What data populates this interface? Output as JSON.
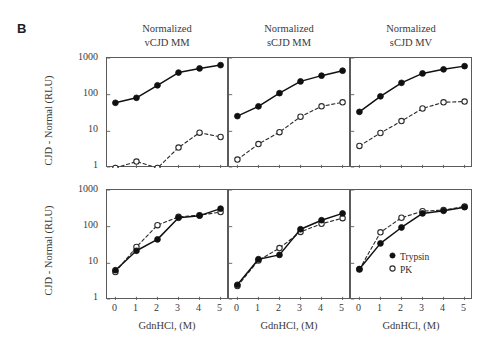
{
  "figure": {
    "panel_label": "B",
    "y_axis_label": "CJD - Normal (RLU)",
    "x_axis_label": "GdnHCl, (M)",
    "y_ticks": [
      "1000",
      "100",
      "10",
      "1"
    ],
    "x_ticks": [
      "0",
      "1",
      "2",
      "3",
      "4",
      "5"
    ],
    "column_titles": [
      {
        "line1": "Normalized",
        "line2": "vCJD MM"
      },
      {
        "line1": "Normalized",
        "line2": "sCJD MM"
      },
      {
        "line1": "Normalized",
        "line2": "sCJD MV"
      }
    ],
    "legend": {
      "items": [
        {
          "label": "Trypsin",
          "marker": "filled-circle",
          "color": "#101010"
        },
        {
          "label": "PK",
          "marker": "open-circle",
          "color": "#2a2a2a"
        }
      ]
    }
  },
  "chart_data": [
    {
      "id": "top-vcjd-mm",
      "type": "line",
      "title": "Normalized vCJD MM",
      "xlabel": "GdnHCl, (M)",
      "ylabel": "CJD - Normal (RLU)",
      "yscale": "log",
      "ylim": [
        1,
        1000
      ],
      "xlim": [
        -0.4,
        5.4
      ],
      "x": [
        0,
        1,
        2,
        3,
        4,
        5
      ],
      "grid": false,
      "series": [
        {
          "name": "Trypsin",
          "marker": "filled-circle",
          "linestyle": "solid",
          "values": [
            60,
            82,
            180,
            400,
            520,
            640
          ]
        },
        {
          "name": "PK",
          "marker": "open-circle",
          "linestyle": "dashed",
          "values": [
            1.0,
            1.5,
            1.0,
            3.6,
            9.2,
            7.0
          ]
        }
      ]
    },
    {
      "id": "top-scjd-mm",
      "type": "line",
      "title": "Normalized sCJD MM",
      "xlabel": "GdnHCl, (M)",
      "ylabel": "CJD - Normal (RLU)",
      "yscale": "log",
      "ylim": [
        1,
        1000
      ],
      "xlim": [
        -0.4,
        5.4
      ],
      "x": [
        0,
        1,
        2,
        3,
        4,
        5
      ],
      "grid": false,
      "series": [
        {
          "name": "Trypsin",
          "marker": "filled-circle",
          "linestyle": "solid",
          "values": [
            26,
            48,
            110,
            230,
            330,
            450
          ]
        },
        {
          "name": "PK",
          "marker": "open-circle",
          "linestyle": "dashed",
          "values": [
            1.7,
            4.5,
            9.5,
            25,
            48,
            62
          ]
        }
      ]
    },
    {
      "id": "top-scjd-mv",
      "type": "line",
      "title": "Normalized sCJD MV",
      "xlabel": "GdnHCl, (M)",
      "ylabel": "CJD - Normal (RLU)",
      "yscale": "log",
      "ylim": [
        1,
        1000
      ],
      "xlim": [
        -0.4,
        5.4
      ],
      "x": [
        0,
        1,
        2,
        3,
        4,
        5
      ],
      "grid": false,
      "series": [
        {
          "name": "Trypsin",
          "marker": "filled-circle",
          "linestyle": "solid",
          "values": [
            34,
            90,
            210,
            380,
            490,
            600
          ]
        },
        {
          "name": "PK",
          "marker": "open-circle",
          "linestyle": "dashed",
          "values": [
            4.0,
            9.0,
            19,
            42,
            62,
            65
          ]
        }
      ]
    },
    {
      "id": "bottom-vcjd-mm",
      "type": "line",
      "title": "vCJD MM",
      "xlabel": "GdnHCl, (M)",
      "ylabel": "CJD - Normal (RLU)",
      "yscale": "log",
      "ylim": [
        1,
        1000
      ],
      "xlim": [
        -0.4,
        5.4
      ],
      "x": [
        0,
        1,
        2,
        3,
        4,
        5
      ],
      "grid": false,
      "series": [
        {
          "name": "Trypsin",
          "marker": "filled-circle",
          "linestyle": "solid",
          "values": [
            6.5,
            22,
            45,
            175,
            200,
            310
          ]
        },
        {
          "name": "PK",
          "marker": "open-circle",
          "linestyle": "dashed",
          "values": [
            5.8,
            28,
            110,
            185,
            205,
            250
          ]
        }
      ]
    },
    {
      "id": "bottom-scjd-mm",
      "type": "line",
      "title": "sCJD MM",
      "xlabel": "GdnHCl, (M)",
      "ylabel": "CJD - Normal (RLU)",
      "yscale": "log",
      "ylim": [
        1,
        1000
      ],
      "xlim": [
        -0.4,
        5.4
      ],
      "x": [
        0,
        1,
        2,
        3,
        4,
        5
      ],
      "grid": false,
      "series": [
        {
          "name": "Trypsin",
          "marker": "filled-circle",
          "linestyle": "solid",
          "values": [
            2.6,
            13,
            17,
            85,
            150,
            230
          ]
        },
        {
          "name": "PK",
          "marker": "open-circle",
          "linestyle": "dashed",
          "values": [
            2.4,
            12,
            26,
            72,
            120,
            170
          ]
        }
      ]
    },
    {
      "id": "bottom-scjd-mv",
      "type": "line",
      "title": "sCJD MV",
      "xlabel": "GdnHCl, (M)",
      "ylabel": "CJD - Normal (RLU)",
      "yscale": "log",
      "ylim": [
        1,
        1000
      ],
      "xlim": [
        -0.4,
        5.4
      ],
      "x": [
        0,
        1,
        2,
        3,
        4,
        5
      ],
      "grid": false,
      "series": [
        {
          "name": "Trypsin",
          "marker": "filled-circle",
          "linestyle": "solid",
          "values": [
            7.0,
            35,
            95,
            230,
            270,
            340
          ]
        },
        {
          "name": "PK",
          "marker": "open-circle",
          "linestyle": "dashed",
          "values": [
            6.8,
            70,
            175,
            265,
            285,
            355
          ]
        }
      ]
    }
  ]
}
